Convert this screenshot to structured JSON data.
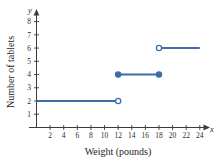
{
  "chart_data": {
    "type": "line",
    "title": "",
    "subtitle": "",
    "xlabel": "Weight (pounds)",
    "ylabel": "Number of tablets",
    "x_axis_variable": "x",
    "y_axis_variable": "y",
    "xlim": [
      0,
      25.5
    ],
    "ylim": [
      0,
      8.8
    ],
    "xticks": [
      2,
      4,
      6,
      8,
      10,
      12,
      14,
      16,
      18,
      20,
      22,
      24
    ],
    "yticks": [
      1,
      2,
      3,
      4,
      5,
      6,
      7,
      8
    ],
    "grid": false,
    "legend": false,
    "series": [
      {
        "name": "tablets-step-function",
        "color": "#3a6ea5",
        "steps": [
          {
            "id": "step-1",
            "y": 2,
            "x_start": 0,
            "x_end": 12,
            "left_endpoint": "none",
            "right_endpoint": "open"
          },
          {
            "id": "step-2",
            "y": 4,
            "x_start": 12,
            "x_end": 18,
            "left_endpoint": "closed",
            "right_endpoint": "closed"
          },
          {
            "id": "step-3",
            "y": 6,
            "x_start": 18,
            "x_end": 24,
            "left_endpoint": "open",
            "right_endpoint": "none"
          }
        ]
      }
    ]
  },
  "colors": {
    "line": "#3a6ea5",
    "axis": "#3c3c3c",
    "text": "#1c1c1c",
    "background": "#ffffff"
  }
}
